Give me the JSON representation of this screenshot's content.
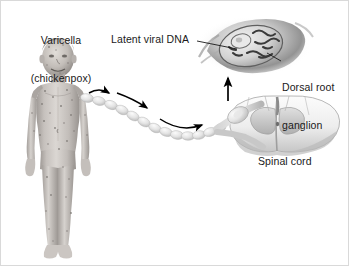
{
  "figure": {
    "background_color": "#ffffff",
    "border_color": "#d9d9d9",
    "text_color": "#1a1a1a",
    "ink_color": "#000000"
  },
  "labels": {
    "varicella": "Varicella\n(chickenpox)",
    "varicella_line1": "Varicella",
    "varicella_line2": "(chickenpox)",
    "latent_viral_dna": "Latent viral DNA",
    "dorsal_root_ganglion": "Dorsal root\nganglion",
    "dorsal_line1": "Dorsal root",
    "dorsal_line2": "ganglion",
    "spinal_cord": "Spinal cord"
  },
  "elements": {
    "child_figure": "child-with-chickenpox-rash",
    "nerve_chain": "peripheral-nerve-bead-chain",
    "ganglion_inset": "magnified-ganglion-cell-with-viral-dna",
    "spinal_cord_section": "spinal-cord-cross-section-gray-matter",
    "arrow_count_pathway": 3,
    "arrow_vertical": "upward-arrow-to-ganglion"
  },
  "colors": {
    "skin_light": "#d8d4d0",
    "skin_mid": "#b4afab",
    "skin_shadow": "#8f8a86",
    "nerve_light": "#ececec",
    "nerve_mid": "#c9c9c9",
    "tissue_gray": "#9a9a9a",
    "tissue_dark": "#5e5e5e",
    "cord_white": "#f2f2f2",
    "cord_gray": "#bdbdbd"
  }
}
